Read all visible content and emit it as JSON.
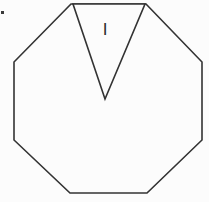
{
  "figure": {
    "background_color": "#fcfcfc",
    "stroke_color": "#333333",
    "stroke_width": 1.6,
    "canvas": {
      "width": 209,
      "height": 202
    },
    "shapes": {
      "octagon": {
        "name": "octagon",
        "sides": 8,
        "points": "71,4 146,4 202,62 202,140 147,193 70,193 14,140 14,62"
      },
      "notch_triangle": {
        "name": "inverted-triangle-notch",
        "sides": 3,
        "orientation": "inverted",
        "points": "73,4 145,4 105,99"
      }
    },
    "labels": {
      "region_one": {
        "text": "I",
        "x": 105,
        "y": 31,
        "font_size": 17,
        "color": "#2b2b2b"
      }
    },
    "artifact": {
      "name": "scan-speck",
      "x": 1,
      "y": 11,
      "width": 3,
      "height": 3,
      "color": "#3a3a3a"
    }
  }
}
